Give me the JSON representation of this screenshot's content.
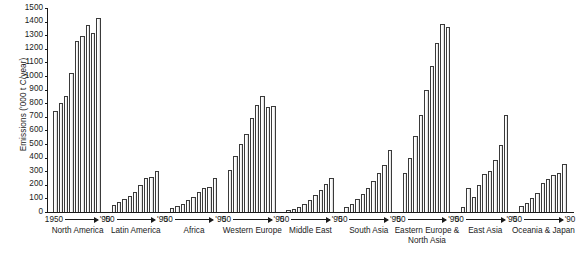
{
  "chart_data": {
    "type": "bar",
    "title": "",
    "xlabel": "",
    "ylabel": "Emissions ('000 t C/year)",
    "ylim": [
      0,
      1500
    ],
    "ytick_values": [
      0,
      100,
      200,
      300,
      400,
      500,
      600,
      700,
      800,
      900,
      1000,
      1100,
      1200,
      1300,
      1400,
      1500
    ],
    "ytick_labels": [
      "0",
      "100",
      "200",
      "300",
      "400",
      "500",
      "600",
      "700",
      "800",
      "900",
      "1000",
      "1100",
      "1200",
      "1300",
      "1400",
      "1500"
    ],
    "grid": false,
    "legend": "none",
    "axis_color": "#1a1a1a",
    "bar_face_color": "#ffffff",
    "bar_edge_color": "#3a3a3a",
    "x_note": "Each group spans 1950 to 1990 in 5-year steps (9 bars per group)",
    "groups": [
      {
        "name": "North America",
        "range_start": "1950",
        "range_end": "'90",
        "categories": [
          "1950",
          "1955",
          "1960",
          "1965",
          "1970",
          "1975",
          "1980",
          "1985",
          "1990"
        ],
        "values": [
          740,
          800,
          855,
          1025,
          1260,
          1295,
          1375,
          1315,
          1425
        ]
      },
      {
        "name": "Latin America",
        "range_start": "'50",
        "range_end": "'90",
        "categories": [
          "1950",
          "1955",
          "1960",
          "1965",
          "1970",
          "1975",
          "1980",
          "1985",
          "1990"
        ],
        "values": [
          55,
          70,
          95,
          120,
          150,
          195,
          250,
          255,
          300
        ]
      },
      {
        "name": "Africa",
        "range_start": "'50",
        "range_end": "'90",
        "categories": [
          "1950",
          "1955",
          "1960",
          "1965",
          "1970",
          "1975",
          "1980",
          "1985",
          "1990"
        ],
        "values": [
          30,
          45,
          60,
          85,
          110,
          150,
          180,
          185,
          250
        ]
      },
      {
        "name": "Western Europe",
        "range_start": "'50",
        "range_end": "'90",
        "categories": [
          "1950",
          "1955",
          "1960",
          "1965",
          "1970",
          "1975",
          "1980",
          "1985",
          "1990"
        ],
        "values": [
          310,
          415,
          500,
          575,
          690,
          790,
          855,
          775,
          780
        ]
      },
      {
        "name": "Middle East",
        "range_start": "'50",
        "range_end": "'90",
        "categories": [
          "1950",
          "1955",
          "1960",
          "1965",
          "1970",
          "1975",
          "1980",
          "1985",
          "1990"
        ],
        "values": [
          15,
          25,
          40,
          60,
          90,
          125,
          165,
          205,
          250
        ]
      },
      {
        "name": "South Asia",
        "range_start": "'50",
        "range_end": "'90",
        "categories": [
          "1950",
          "1955",
          "1960",
          "1965",
          "1970",
          "1975",
          "1980",
          "1985",
          "1990"
        ],
        "values": [
          40,
          60,
          95,
          130,
          175,
          230,
          290,
          345,
          455
        ]
      },
      {
        "name": "Eastern Europe & North Asia",
        "range_start": "'50",
        "range_end": "'90",
        "categories": [
          "1950",
          "1955",
          "1960",
          "1965",
          "1970",
          "1975",
          "1980",
          "1985",
          "1990"
        ],
        "values": [
          290,
          400,
          560,
          715,
          900,
          1070,
          1240,
          1380,
          1360
        ]
      },
      {
        "name": "East Asia",
        "range_start": "'50",
        "range_end": "'90",
        "categories": [
          "1950",
          "1955",
          "1960",
          "1965",
          "1970",
          "1975",
          "1980",
          "1985",
          "1990"
        ],
        "values": [
          40,
          180,
          110,
          200,
          280,
          300,
          385,
          490,
          710
        ]
      },
      {
        "name": "Oceania & Japan",
        "range_start": "'50",
        "range_end": "'90",
        "categories": [
          "1950",
          "1955",
          "1960",
          "1965",
          "1970",
          "1975",
          "1980",
          "1985",
          "1990"
        ],
        "values": [
          45,
          65,
          100,
          140,
          215,
          240,
          270,
          290,
          355
        ]
      }
    ]
  }
}
